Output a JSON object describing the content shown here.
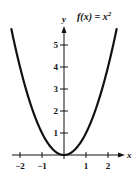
{
  "chart_data": {
    "type": "line",
    "title_parts": {
      "lhs": "f(x) = x",
      "exp": "2"
    },
    "xlabel": "x",
    "ylabel": "y",
    "xlim": [
      -2.4,
      2.7
    ],
    "ylim": [
      0,
      5.9
    ],
    "x_ticks": [
      -2,
      -1,
      1,
      2
    ],
    "x_tick_labels": [
      "−2",
      "−1",
      "1",
      "2"
    ],
    "y_ticks": [
      1,
      2,
      3,
      4,
      5
    ],
    "y_tick_labels": [
      "1",
      "2",
      "3",
      "4",
      "5"
    ],
    "grid": false,
    "legend": "none",
    "series": [
      {
        "name": "f(x) = x^2",
        "x": [
          -2.4,
          -2,
          -1.5,
          -1,
          -0.5,
          0,
          0.5,
          1,
          1.5,
          2,
          2.4
        ],
        "y": [
          5.76,
          4,
          2.25,
          1,
          0.25,
          0,
          0.25,
          1,
          2.25,
          4,
          5.76
        ]
      }
    ]
  },
  "layout": {
    "origin_px": [
      64,
      155
    ],
    "unit_px": 22,
    "line_color": "#111111"
  }
}
